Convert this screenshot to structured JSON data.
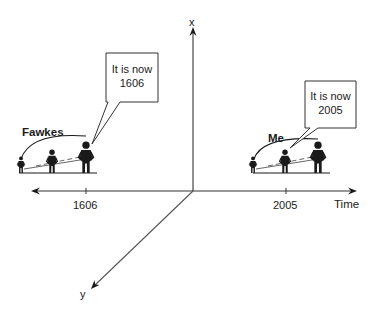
{
  "axes": {
    "vertical_label": "x",
    "diagonal_label": "y",
    "horizontal_label": "Time",
    "ticks": [
      "1606",
      "2005"
    ]
  },
  "groups": [
    {
      "name": "Fawkes",
      "tick": "1606",
      "speech_line1": "It is now",
      "speech_line2": "1606"
    },
    {
      "name": "Me",
      "tick": "2005",
      "speech_line1": "It is now",
      "speech_line2": "2005"
    }
  ],
  "colors": {
    "ink": "#1a1a1a",
    "axis": "#333333",
    "background": "#ffffff"
  }
}
